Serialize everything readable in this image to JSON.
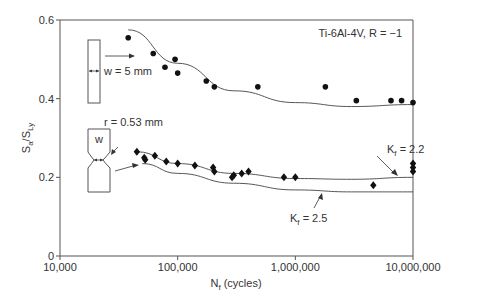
{
  "chart_data": {
    "type": "scatter",
    "title": "",
    "xlabel": "N_f (cycles)",
    "xlabel_main": "N",
    "xlabel_sub": "f",
    "xlabel_rest": " (cycles)",
    "ylabel": "Sa/SLy",
    "ylabel_parts": {
      "s1": "S",
      "sub1": "a",
      "mid": "/S",
      "sub2": "Ly"
    },
    "xscale": "log",
    "xlim": [
      10000,
      10000000
    ],
    "ylim": [
      0,
      0.6
    ],
    "x_ticks": [
      10000,
      100000,
      1000000,
      10000000
    ],
    "x_tick_labels": [
      "10,000",
      "100,000",
      "1,000,000",
      "10,000,000"
    ],
    "y_ticks": [
      0,
      0.2,
      0.4,
      0.6
    ],
    "y_tick_labels": [
      "0",
      "0.2",
      "0.4",
      "0.6"
    ],
    "grid": false,
    "annotations": {
      "material": "Ti-6Al-4V, R = −1",
      "smooth_width": "w = 5 mm",
      "notch_radius": "r = 0.53 mm",
      "notch_w": "w",
      "kf_22": {
        "main": "K",
        "sub": "f",
        "rest": " = 2.2"
      },
      "kf_25": {
        "main": "K",
        "sub": "f",
        "rest": " = 2.5"
      }
    },
    "series": [
      {
        "name": "Smooth specimen (w = 5 mm)",
        "marker": "circle",
        "points": [
          [
            38000,
            0.555
          ],
          [
            62000,
            0.515
          ],
          [
            78000,
            0.48
          ],
          [
            95000,
            0.5
          ],
          [
            100000,
            0.465
          ],
          [
            175000,
            0.445
          ],
          [
            205000,
            0.43
          ],
          [
            480000,
            0.43
          ],
          [
            1800000,
            0.43
          ],
          [
            3300000,
            0.395
          ],
          [
            6500000,
            0.395
          ],
          [
            8000000,
            0.395
          ],
          [
            10000000,
            0.39
          ]
        ]
      },
      {
        "name": "Notched specimen (r = 0.53 mm)",
        "marker": "diamond",
        "points": [
          [
            45000,
            0.265
          ],
          [
            52000,
            0.25
          ],
          [
            53000,
            0.245
          ],
          [
            64000,
            0.255
          ],
          [
            80000,
            0.24
          ],
          [
            100000,
            0.235
          ],
          [
            140000,
            0.23
          ],
          [
            200000,
            0.225
          ],
          [
            205000,
            0.215
          ],
          [
            290000,
            0.2
          ],
          [
            300000,
            0.205
          ],
          [
            350000,
            0.21
          ],
          [
            400000,
            0.215
          ],
          [
            800000,
            0.2
          ],
          [
            1000000,
            0.2
          ],
          [
            4600000,
            0.18
          ],
          [
            10000000,
            0.235
          ],
          [
            10000000,
            0.225
          ],
          [
            10000000,
            0.215
          ]
        ]
      },
      {
        "name": "Smooth fit curve",
        "type": "line",
        "points": [
          [
            38000,
            0.575
          ],
          [
            100000,
            0.49
          ],
          [
            300000,
            0.42
          ],
          [
            1000000,
            0.39
          ],
          [
            3000000,
            0.38
          ],
          [
            10000000,
            0.385
          ]
        ]
      },
      {
        "name": "Kf = 2.2 prediction",
        "type": "line",
        "points": [
          [
            45000,
            0.265
          ],
          [
            100000,
            0.235
          ],
          [
            300000,
            0.21
          ],
          [
            1000000,
            0.197
          ],
          [
            3000000,
            0.195
          ],
          [
            10000000,
            0.2
          ]
        ]
      },
      {
        "name": "Kf = 2.5 prediction",
        "type": "line",
        "points": [
          [
            50000,
            0.235
          ],
          [
            100000,
            0.21
          ],
          [
            300000,
            0.185
          ],
          [
            1000000,
            0.168
          ],
          [
            3000000,
            0.163
          ],
          [
            10000000,
            0.163
          ]
        ]
      }
    ]
  }
}
